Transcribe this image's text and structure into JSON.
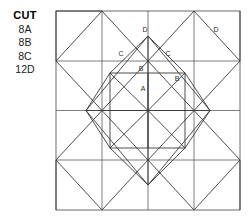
{
  "legend": {
    "title": "CUT",
    "items": [
      {
        "label": "8A"
      },
      {
        "label": "8B"
      },
      {
        "label": "8C"
      },
      {
        "label": "12D"
      }
    ]
  },
  "diagram": {
    "name": "quilt-block-piecing-diagram",
    "frame": {
      "x": 56,
      "y": 11,
      "width": 184,
      "height": 199
    },
    "colors": {
      "line": "#3a3a3a",
      "frame": "#6b6b6b",
      "grid": "#5a5a5a",
      "background": "#ffffff",
      "label_text": "#2b2b2b"
    },
    "patch_labels": [
      {
        "text": "D",
        "x": 145,
        "y": 30
      },
      {
        "text": "D",
        "x": 216,
        "y": 30
      },
      {
        "text": "C",
        "x": 121,
        "y": 54
      },
      {
        "text": "C",
        "x": 168,
        "y": 54
      },
      {
        "text": "B",
        "x": 141,
        "y": 69
      },
      {
        "text": "B",
        "x": 177,
        "y": 79
      },
      {
        "text": "A",
        "x": 143,
        "y": 89
      }
    ]
  }
}
